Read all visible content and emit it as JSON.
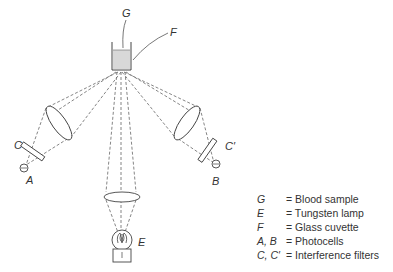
{
  "figure": {
    "labels": {
      "G": "G",
      "F": "F",
      "C": "C",
      "C_prime": "C′",
      "A": "A",
      "B": "B",
      "E": "E"
    },
    "colors": {
      "line": "#555555",
      "sample_fill": "#d8d8d8",
      "text": "#333333"
    }
  },
  "legend": {
    "items": [
      {
        "key": "G",
        "value": "= Blood sample"
      },
      {
        "key": "E",
        "value": "= Tungsten lamp"
      },
      {
        "key": "F",
        "value": "= Glass cuvette"
      },
      {
        "key": "A, B",
        "value": "= Photocells"
      },
      {
        "key": "C, C′",
        "value": "= Interference filters"
      }
    ]
  }
}
